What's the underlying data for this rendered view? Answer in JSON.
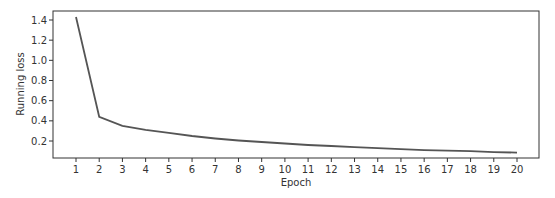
{
  "chart_data": {
    "type": "line",
    "title": "",
    "xlabel": "Epoch",
    "ylabel": "Running loss",
    "x": [
      1,
      2,
      3,
      4,
      5,
      6,
      7,
      8,
      9,
      10,
      11,
      12,
      13,
      14,
      15,
      16,
      17,
      18,
      19,
      20
    ],
    "series": [
      {
        "name": "Running loss",
        "color": "#555555",
        "values": [
          1.43,
          0.44,
          0.35,
          0.31,
          0.28,
          0.25,
          0.225,
          0.205,
          0.19,
          0.175,
          0.16,
          0.15,
          0.14,
          0.13,
          0.12,
          0.11,
          0.105,
          0.1,
          0.09,
          0.085
        ]
      }
    ],
    "xticks": [
      "1",
      "2",
      "3",
      "4",
      "5",
      "6",
      "7",
      "8",
      "9",
      "10",
      "11",
      "12",
      "13",
      "14",
      "15",
      "16",
      "17",
      "18",
      "19",
      "20"
    ],
    "yticks": [
      0.2,
      0.4,
      0.6,
      0.8,
      1.0,
      1.2,
      1.4
    ],
    "ytick_labels": [
      "0.2",
      "0.4",
      "0.6",
      "0.8",
      "1.0",
      "1.2",
      "1.4"
    ],
    "xlim": [
      0.05,
      20.95
    ],
    "ylim": [
      0.03,
      1.49
    ],
    "grid": false,
    "legend": null
  }
}
